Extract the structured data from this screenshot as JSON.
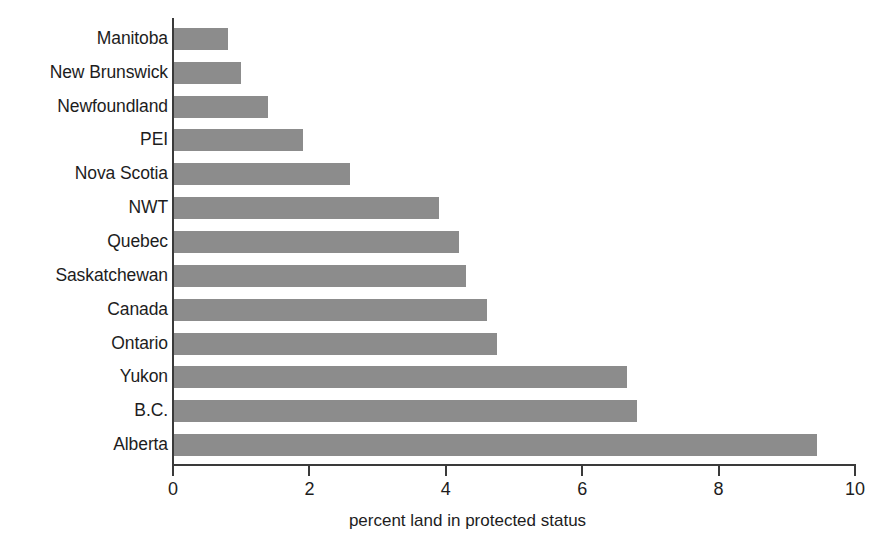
{
  "chart_data": {
    "type": "bar",
    "orientation": "horizontal",
    "title": "",
    "xlabel": "percent land in protected status",
    "ylabel": "",
    "xlim": [
      0,
      10
    ],
    "xticks": [
      0,
      2,
      4,
      6,
      8,
      10
    ],
    "xtick_labels": [
      "0",
      "2",
      "4",
      "6",
      "8",
      "10"
    ],
    "grid": false,
    "legend": false,
    "bar_color": "#8c8c8c",
    "axis_color": "#3a3a3a",
    "categories": [
      "Manitoba",
      "New Brunswick",
      "Newfoundland",
      "PEI",
      "Nova Scotia",
      "NWT",
      "Quebec",
      "Saskatchewan",
      "Canada",
      "Ontario",
      "Yukon",
      "B.C.",
      "Alberta"
    ],
    "values": [
      0.8,
      1.0,
      1.4,
      1.9,
      2.6,
      3.9,
      4.2,
      4.3,
      4.6,
      4.75,
      6.65,
      6.8,
      9.45
    ],
    "bars": [
      {
        "label": "Manitoba",
        "value": 0.8
      },
      {
        "label": "New Brunswick",
        "value": 1.0
      },
      {
        "label": "Newfoundland",
        "value": 1.4
      },
      {
        "label": "PEI",
        "value": 1.9
      },
      {
        "label": "Nova Scotia",
        "value": 2.6
      },
      {
        "label": "NWT",
        "value": 3.9
      },
      {
        "label": "Quebec",
        "value": 4.2
      },
      {
        "label": "Saskatchewan",
        "value": 4.3
      },
      {
        "label": "Canada",
        "value": 4.6
      },
      {
        "label": "Ontario",
        "value": 4.75
      },
      {
        "label": "Yukon",
        "value": 6.65
      },
      {
        "label": "B.C.",
        "value": 6.8
      },
      {
        "label": "Alberta",
        "value": 9.45
      }
    ]
  }
}
